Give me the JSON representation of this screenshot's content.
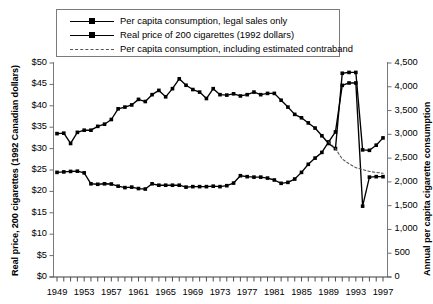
{
  "chart_data": {
    "type": "line",
    "title": "",
    "xlabel": "",
    "ylabel": "Real price, 200 cigarettes (1992 Canadian dollars)",
    "ylabel_right": "Annual per capita cigarette consumption",
    "grid": false,
    "legend_position": "top",
    "x": [
      1949,
      1950,
      1951,
      1952,
      1953,
      1954,
      1955,
      1956,
      1957,
      1958,
      1959,
      1960,
      1961,
      1962,
      1963,
      1964,
      1965,
      1966,
      1967,
      1968,
      1969,
      1970,
      1971,
      1972,
      1973,
      1974,
      1975,
      1976,
      1977,
      1978,
      1979,
      1980,
      1981,
      1982,
      1983,
      1984,
      1985,
      1986,
      1987,
      1988,
      1989,
      1990,
      1991,
      1992,
      1993,
      1994,
      1995,
      1996,
      1997
    ],
    "xtick_labels": [
      "1949",
      "1953",
      "1957",
      "1961",
      "1965",
      "1969",
      "1973",
      "1977",
      "1981",
      "1985",
      "1989",
      "1993",
      "1997"
    ],
    "xtick_values": [
      1949,
      1953,
      1957,
      1961,
      1965,
      1969,
      1973,
      1977,
      1981,
      1985,
      1989,
      1993,
      1997
    ],
    "xlim": [
      1949,
      1997
    ],
    "ylim_left": [
      0,
      50
    ],
    "ytick_labels_left": [
      "$0",
      "$5",
      "$10",
      "$15",
      "$20",
      "$25",
      "$30",
      "$35",
      "$40",
      "$45",
      "$50"
    ],
    "ytick_values_left": [
      0,
      5,
      10,
      15,
      20,
      25,
      30,
      35,
      40,
      45,
      50
    ],
    "ylim_right": [
      0,
      4500
    ],
    "ytick_labels_right": [
      "0",
      "500",
      "1,000",
      "1,500",
      "2,000",
      "2,500",
      "3,000",
      "3,500",
      "4,000",
      "4,500"
    ],
    "ytick_values_right": [
      0,
      500,
      1000,
      1500,
      2000,
      2500,
      3000,
      3500,
      4000,
      4500
    ],
    "series": [
      {
        "name": "Real price of 200 cigarettes (1992 dollars)",
        "axis": "left",
        "style": "solid-marker",
        "color": "#000000",
        "values": [
          33.5,
          33.6,
          31.2,
          33.8,
          34.3,
          34.3,
          35.2,
          35.7,
          36.8,
          39.3,
          39.7,
          40.2,
          41.5,
          41.0,
          42.6,
          43.6,
          42.1,
          44.0,
          46.3,
          44.8,
          43.8,
          43.2,
          41.7,
          44.0,
          42.6,
          42.5,
          42.8,
          42.3,
          42.6,
          43.2,
          42.6,
          42.9,
          42.9,
          41.3,
          39.7,
          38.0,
          37.2,
          36.0,
          34.8,
          33.0,
          31.2,
          30.0,
          47.6,
          47.8,
          47.8,
          29.7,
          29.6,
          30.8,
          32.5
        ]
      },
      {
        "name": "Per capita consumption, legal sales only",
        "axis": "right",
        "style": "solid-marker",
        "color": "#000000",
        "values": [
          2200,
          2210,
          2220,
          2225,
          2190,
          1960,
          1950,
          1960,
          1955,
          1910,
          1880,
          1890,
          1860,
          1850,
          1960,
          1930,
          1930,
          1930,
          1930,
          1890,
          1900,
          1900,
          1900,
          1910,
          1900,
          1920,
          1975,
          2130,
          2110,
          2100,
          2100,
          2080,
          2040,
          1970,
          1990,
          2060,
          2200,
          2370,
          2500,
          2620,
          2840,
          3050,
          4030,
          4080,
          4080,
          1490,
          2100,
          2110,
          2110
        ]
      },
      {
        "name": "Per capita consumption, including estimated contraband",
        "axis": "right",
        "style": "dashed",
        "color": "#555555",
        "values": [
          null,
          null,
          null,
          null,
          null,
          null,
          null,
          null,
          null,
          null,
          null,
          null,
          null,
          null,
          null,
          null,
          null,
          null,
          null,
          null,
          null,
          null,
          null,
          null,
          null,
          null,
          null,
          null,
          null,
          null,
          null,
          null,
          null,
          null,
          null,
          null,
          null,
          null,
          null,
          null,
          2840,
          2700,
          2480,
          2380,
          2300,
          2260,
          2220,
          2200,
          2180
        ]
      }
    ]
  },
  "legend": {
    "items": [
      {
        "label": "Per capita consumption, legal sales only",
        "style": "solid-marker"
      },
      {
        "label": "Real price of 200 cigarettes (1992 dollars)",
        "style": "solid-marker"
      },
      {
        "label": "Per capita consumption, including estimated contraband",
        "style": "dashed"
      }
    ]
  }
}
